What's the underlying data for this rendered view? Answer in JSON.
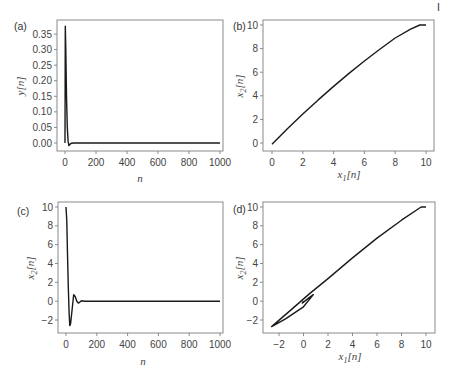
{
  "page_marker": "I",
  "chart_data": [
    {
      "panel": "(a)",
      "type": "line",
      "xlabel": "n",
      "ylabel": "y[n]",
      "xticks": [
        "0",
        "200",
        "400",
        "600",
        "800",
        "1000"
      ],
      "yticks": [
        "0.00",
        "0.05",
        "0.10",
        "0.15",
        "0.20",
        "0.25",
        "0.30",
        "0.35"
      ],
      "xlim": [
        0,
        1000
      ],
      "ylim": [
        -0.01,
        0.38
      ],
      "x": [
        0,
        2,
        5,
        10,
        15,
        20,
        25,
        30,
        40,
        60,
        100,
        1000
      ],
      "y": [
        0.0,
        0.375,
        0.3,
        0.15,
        0.05,
        0.005,
        -0.008,
        -0.005,
        -0.001,
        0.0,
        0.0,
        0.0
      ]
    },
    {
      "panel": "(b)",
      "type": "line",
      "xlabel": "x1[n]",
      "ylabel": "x2[n]",
      "xticks": [
        "0",
        "2",
        "4",
        "6",
        "8",
        "10"
      ],
      "yticks": [
        "0",
        "2",
        "4",
        "6",
        "8",
        "10"
      ],
      "xlim": [
        -0.3,
        10.5
      ],
      "ylim": [
        -0.4,
        10.4
      ],
      "x": [
        0.0,
        1.0,
        2.0,
        3.0,
        4.0,
        5.0,
        6.0,
        7.0,
        8.0,
        9.0,
        9.6,
        10.0
      ],
      "y": [
        -0.1,
        1.2,
        2.45,
        3.65,
        4.8,
        5.9,
        6.95,
        7.95,
        8.9,
        9.65,
        10.0,
        10.0
      ]
    },
    {
      "panel": "(c)",
      "type": "line",
      "xlabel": "n",
      "ylabel": "x2[n]",
      "xticks": [
        "0",
        "200",
        "400",
        "600",
        "800",
        "1000"
      ],
      "yticks": [
        "-2",
        "0",
        "2",
        "4",
        "6",
        "8",
        "10"
      ],
      "xlim": [
        0,
        1000
      ],
      "ylim": [
        -3.2,
        10.5
      ],
      "x": [
        0,
        5,
        10,
        15,
        20,
        25,
        30,
        40,
        50,
        60,
        70,
        80,
        90,
        100,
        120,
        150,
        1000
      ],
      "y": [
        10,
        8.5,
        5.0,
        1.5,
        -1.2,
        -2.6,
        -2.4,
        -0.8,
        0.7,
        0.5,
        0.0,
        -0.2,
        -0.1,
        0.05,
        0.0,
        0.0,
        0.0
      ]
    },
    {
      "panel": "(d)",
      "type": "line",
      "xlabel": "x1[n]",
      "ylabel": "x2[n]",
      "xticks": [
        "-2",
        "0",
        "2",
        "4",
        "6",
        "8",
        "10"
      ],
      "yticks": [
        "-2",
        "0",
        "2",
        "4",
        "6",
        "8",
        "10"
      ],
      "xlim": [
        -2.8,
        10.6
      ],
      "ylim": [
        -3.2,
        10.5
      ],
      "x": [
        10.0,
        9.6,
        8.0,
        6.0,
        4.0,
        2.0,
        0.5,
        -1.0,
        -2.6,
        -1.5,
        0.0,
        0.8,
        0.5,
        0.0,
        -0.1,
        0.0
      ],
      "y": [
        10.0,
        10.0,
        8.6,
        6.7,
        4.6,
        2.4,
        0.8,
        -0.9,
        -2.7,
        -1.9,
        -0.6,
        0.7,
        0.4,
        -0.1,
        -0.2,
        0.0
      ]
    }
  ]
}
